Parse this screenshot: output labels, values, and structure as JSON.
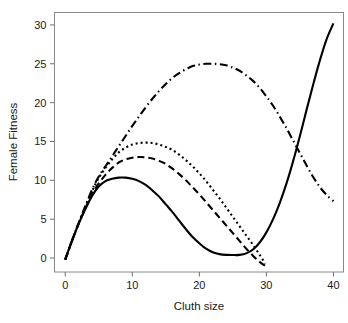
{
  "chart_data": {
    "type": "line",
    "title": "",
    "xlabel": "Cluth size",
    "ylabel": "Female Fitness",
    "xlim": [
      -1.6,
      41.5
    ],
    "ylim": [
      -1.8,
      31.6
    ],
    "xticks": [
      0,
      10,
      20,
      30,
      40
    ],
    "xtick_labels": [
      "0",
      "10",
      "20",
      "30",
      "40"
    ],
    "yticks": [
      0,
      5,
      10,
      15,
      20,
      25,
      30
    ],
    "ytick_labels": [
      "0",
      "5",
      "10",
      "15",
      "20",
      "25",
      "30"
    ],
    "grid": false,
    "legend": "none",
    "frame": true,
    "series": [
      {
        "name": "solid-curve",
        "style": "solid",
        "dasharray": "none",
        "color": "#000000",
        "x": [
          0,
          1,
          2,
          3,
          4,
          5,
          6,
          7,
          8,
          9,
          10,
          11,
          12,
          13,
          14,
          15,
          16,
          17,
          18,
          19,
          20,
          21,
          22,
          23,
          24,
          25,
          26,
          27,
          28,
          29,
          30,
          31,
          32,
          33,
          34,
          35,
          36,
          37,
          38,
          39,
          40
        ],
        "y": [
          -0.2,
          2.2,
          4.4,
          6.3,
          8.0,
          9.2,
          9.9,
          10.2,
          10.35,
          10.35,
          10.2,
          9.9,
          9.4,
          8.7,
          7.9,
          6.9,
          5.9,
          4.8,
          3.7,
          2.7,
          1.9,
          1.2,
          0.75,
          0.5,
          0.4,
          0.38,
          0.4,
          0.6,
          1.1,
          2.0,
          3.3,
          5.0,
          7.1,
          9.6,
          12.5,
          15.7,
          19.1,
          22.4,
          25.5,
          28.2,
          30.2
        ]
      },
      {
        "name": "dashed-curve",
        "style": "dashed",
        "dasharray": "7,4",
        "color": "#000000",
        "x": [
          0,
          1,
          2,
          3,
          4,
          5,
          6,
          7,
          8,
          9,
          10,
          11,
          12,
          13,
          14,
          15,
          16,
          17,
          18,
          19,
          20,
          21,
          22,
          23,
          24,
          25,
          26,
          27,
          28,
          29,
          29.8
        ],
        "y": [
          -0.2,
          2.2,
          4.4,
          6.4,
          8.2,
          9.6,
          10.7,
          11.6,
          12.3,
          12.7,
          12.9,
          13.0,
          12.95,
          12.8,
          12.5,
          12.1,
          11.5,
          10.8,
          10.0,
          9.1,
          8.2,
          7.2,
          6.2,
          5.2,
          4.2,
          3.2,
          2.2,
          1.2,
          0.3,
          -0.5,
          -1.0
        ]
      },
      {
        "name": "dotted-curve",
        "style": "dotted",
        "dasharray": "2,3",
        "color": "#000000",
        "x": [
          0,
          1,
          2,
          3,
          4,
          5,
          6,
          7,
          8,
          9,
          10,
          11,
          12,
          13,
          14,
          15,
          16,
          17,
          18,
          19,
          20,
          21,
          22,
          23,
          24,
          25,
          26,
          27,
          28,
          29,
          29.8
        ],
        "y": [
          -0.2,
          2.2,
          4.5,
          6.6,
          8.6,
          10.3,
          11.6,
          12.7,
          13.6,
          14.2,
          14.6,
          14.8,
          14.85,
          14.8,
          14.6,
          14.3,
          13.9,
          13.3,
          12.6,
          11.8,
          10.9,
          9.9,
          8.8,
          7.7,
          6.5,
          5.3,
          4.1,
          2.9,
          1.7,
          0.4,
          -0.7
        ]
      },
      {
        "name": "dash-dot-curve",
        "style": "dashdot",
        "dasharray": "8,3.5,1.5,3.5",
        "color": "#000000",
        "x": [
          0,
          1,
          2,
          3,
          4,
          5,
          6,
          7,
          8,
          9,
          10,
          11,
          12,
          13,
          14,
          15,
          16,
          17,
          18,
          19,
          20,
          21,
          22,
          23,
          24,
          25,
          26,
          27,
          28,
          29,
          30,
          31,
          32,
          33,
          34,
          35,
          36,
          37,
          38,
          39,
          40
        ],
        "y": [
          -0.2,
          2.2,
          4.5,
          6.7,
          8.8,
          10.5,
          11.8,
          13.1,
          14.4,
          15.7,
          17.0,
          18.2,
          19.4,
          20.5,
          21.5,
          22.4,
          23.2,
          23.8,
          24.3,
          24.7,
          24.9,
          25.0,
          25.0,
          24.95,
          24.8,
          24.5,
          24.1,
          23.5,
          22.8,
          21.9,
          20.8,
          19.6,
          18.2,
          16.7,
          15.1,
          13.5,
          11.9,
          10.4,
          9.1,
          8.1,
          7.3
        ]
      }
    ]
  }
}
